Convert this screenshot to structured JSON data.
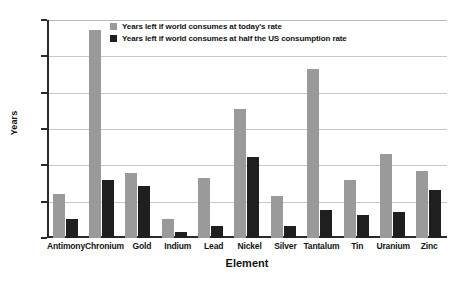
{
  "chart_data": {
    "type": "bar",
    "title": "",
    "xlabel": "Element",
    "ylabel": "Years",
    "ylim": [
      0,
      150
    ],
    "yticks": [
      0,
      25,
      50,
      75,
      100,
      125,
      150
    ],
    "grid": true,
    "legend_position": "top-center",
    "categories": [
      "Antimony",
      "Chronium",
      "Gold",
      "Indium",
      "Lead",
      "Nickel",
      "Silver",
      "Tantalum",
      "Tin",
      "Uranium",
      "Zinc"
    ],
    "series": [
      {
        "name": "Years left if world consumes at today's rate",
        "color": "#9a9a9a",
        "values": [
          30,
          143,
          45,
          13,
          41,
          89,
          29,
          116,
          40,
          58,
          46
        ]
      },
      {
        "name": "Years left if world consumes at half the US consumption rate",
        "color": "#1f1f1f",
        "values": [
          13,
          40,
          36,
          4,
          8,
          56,
          8,
          19,
          16,
          18,
          33
        ]
      }
    ]
  },
  "axis": {
    "y_title": "Years",
    "x_title": "Element",
    "tick_labels": [
      "0",
      "25",
      "50",
      "75",
      "100",
      "125",
      "150"
    ]
  }
}
